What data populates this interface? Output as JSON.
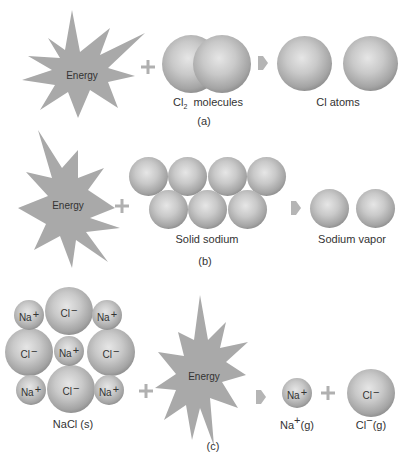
{
  "colors": {
    "starburst": "#a9a9a9",
    "operator": "#b0b0b0",
    "sphere_dark": "#555555",
    "sphere_light": "#e6e6e6",
    "text": "#333333"
  },
  "panel_a": {
    "energy_label": "Energy",
    "reactant_label_main": "Cl",
    "reactant_label_sub": "2",
    "reactant_label_rest": "molecules",
    "product_label": "Cl atoms",
    "caption": "(a)"
  },
  "panel_b": {
    "energy_label": "Energy",
    "reactant_label": "Solid sodium",
    "product_label": "Sodium vapor",
    "caption": "(b)"
  },
  "panel_c": {
    "energy_label": "Energy",
    "lattice_label": "NaCl (s)",
    "lattice_ions": [
      {
        "symbol": "Na",
        "charge": "+"
      },
      {
        "symbol": "Cl",
        "charge": "−"
      },
      {
        "symbol": "Na",
        "charge": "+"
      },
      {
        "symbol": "Cl",
        "charge": "−"
      },
      {
        "symbol": "Na",
        "charge": "+"
      },
      {
        "symbol": "Cl",
        "charge": "−"
      },
      {
        "symbol": "Na",
        "charge": "+"
      },
      {
        "symbol": "Cl",
        "charge": "−"
      },
      {
        "symbol": "Na",
        "charge": "+"
      }
    ],
    "product_na": {
      "symbol": "Na",
      "charge": "+",
      "label_symbol": "Na",
      "label_charge": "+",
      "label_state": "(g)"
    },
    "product_cl": {
      "symbol": "Cl",
      "charge": "−",
      "label_symbol": "Cl",
      "label_charge": "−",
      "label_state": "(g)"
    },
    "caption": "(c)"
  }
}
